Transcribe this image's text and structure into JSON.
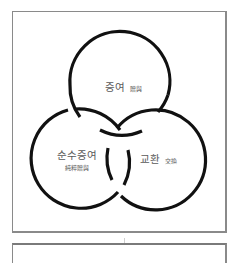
{
  "diagram": {
    "type": "venn",
    "circles": [
      {
        "id": "gift",
        "label_ko": "증여",
        "label_hanja": "贈與"
      },
      {
        "id": "pure-gift",
        "label_ko": "순수증여",
        "label_hanja": "純粹贈與"
      },
      {
        "id": "exchange",
        "label_ko": "교환",
        "label_hanja": "交換"
      }
    ],
    "stroke_color": "#111111",
    "text_color": "#5a5a5a",
    "frame_color": "#8a8a8a"
  }
}
